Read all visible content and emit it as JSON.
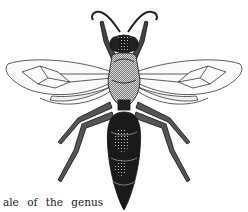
{
  "illustration": {
    "subject": "wasp engraving",
    "description": "Dorsal view of a wasp with outspread wings, antennae, legs and segmented abdomen"
  },
  "caption": {
    "text": "ale of the genus"
  }
}
